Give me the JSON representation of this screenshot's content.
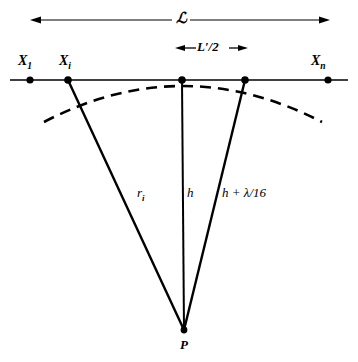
{
  "figure": {
    "type": "geometry-diagram",
    "background_color": "#ffffff",
    "ink_color": "#000000"
  },
  "dimensions": {
    "overall": {
      "label": "ℒ",
      "label_name": "script-L",
      "arrow_style": "double-headed",
      "x_start": 30,
      "x_end": 330,
      "y": 20
    },
    "half_segment": {
      "label_main": "L",
      "label_prime": "′",
      "label_rest": "/2",
      "label_full": "L′/2",
      "arrow_style": "double-headed",
      "x_start": 175,
      "x_end": 248,
      "y": 48
    }
  },
  "baseline": {
    "y": 80,
    "x_start": 10,
    "x_end": 348,
    "nodes": [
      {
        "name": "x-1",
        "x": 30,
        "label_main": "X",
        "label_sub": "1",
        "has_label": true,
        "label_x": 18,
        "label_y": 56
      },
      {
        "name": "x-i",
        "x": 68,
        "label_main": "X",
        "label_sub": "i",
        "has_label": true,
        "label_x": 58,
        "label_y": 56
      },
      {
        "name": "x-center",
        "x": 182,
        "label_main": "",
        "label_sub": "",
        "has_label": false,
        "label_x": 0,
        "label_y": 0
      },
      {
        "name": "x-right",
        "x": 245,
        "label_main": "",
        "label_sub": "",
        "has_label": false,
        "label_x": 0,
        "label_y": 0
      },
      {
        "name": "x-n",
        "x": 328,
        "label_main": "X",
        "label_sub": "n",
        "has_label": true,
        "label_x": 312,
        "label_y": 56
      }
    ]
  },
  "apex": {
    "name": "P",
    "label": "P",
    "x": 184,
    "y": 330,
    "label_x": 180,
    "label_y": 340
  },
  "rays": [
    {
      "name": "ray-r-i",
      "from_x": 68,
      "from_y": 80,
      "to_x": 184,
      "to_y": 330,
      "label_main": "r",
      "label_sub": "i",
      "label_full": "rᵢ",
      "label_x": 138,
      "label_y": 188
    },
    {
      "name": "ray-h",
      "from_x": 182,
      "from_y": 80,
      "to_x": 184,
      "to_y": 330,
      "label_main": "h",
      "label_sub": "",
      "label_full": "h",
      "label_x": 186,
      "label_y": 189
    },
    {
      "name": "ray-h-plus-lambda",
      "from_x": 245,
      "from_y": 80,
      "to_x": 184,
      "to_y": 330,
      "label_main": "h + λ/16",
      "label_sub": "",
      "label_full": "h + λ/16",
      "label_x": 222,
      "label_y": 189
    }
  ],
  "arc": {
    "name": "wavefront-arc",
    "style": "dashed",
    "dash_pattern": "11 7",
    "tangent_point_x": 182,
    "tangent_point_y": 80,
    "left_end_x": 44,
    "left_end_y": 122,
    "right_end_x": 322,
    "right_end_y": 122,
    "stroke_width": 2.6
  }
}
